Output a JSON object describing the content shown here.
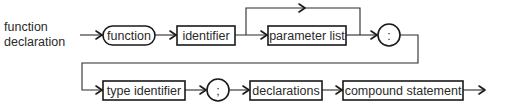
{
  "diagram": {
    "type": "syntax-diagram",
    "title_line1": "function",
    "title_line2": "declaration",
    "nodes": [
      {
        "id": "function",
        "label": "function",
        "kind": "terminal",
        "shape": "rounded"
      },
      {
        "id": "identifier",
        "label": "identifier",
        "kind": "nonterminal",
        "shape": "box"
      },
      {
        "id": "parameter-list",
        "label": "parameter list",
        "kind": "nonterminal",
        "shape": "box",
        "optional": true
      },
      {
        "id": "colon",
        "label": ":",
        "kind": "terminal",
        "shape": "circle"
      },
      {
        "id": "type-identifier",
        "label": "type identifier",
        "kind": "nonterminal",
        "shape": "box"
      },
      {
        "id": "semicolon",
        "label": ";",
        "kind": "terminal",
        "shape": "circle"
      },
      {
        "id": "declarations",
        "label": "declarations",
        "kind": "nonterminal",
        "shape": "box"
      },
      {
        "id": "compound-statement",
        "label": "compound statement",
        "kind": "nonterminal",
        "shape": "box"
      }
    ],
    "edges": [
      {
        "from": "start",
        "to": "function"
      },
      {
        "from": "function",
        "to": "identifier"
      },
      {
        "from": "identifier",
        "to": "parameter-list"
      },
      {
        "from": "identifier",
        "to": "colon",
        "note": "bypass over parameter list"
      },
      {
        "from": "parameter-list",
        "to": "colon"
      },
      {
        "from": "colon",
        "to": "type-identifier",
        "note": "wraps to second row"
      },
      {
        "from": "type-identifier",
        "to": "semicolon"
      },
      {
        "from": "semicolon",
        "to": "declarations"
      },
      {
        "from": "declarations",
        "to": "compound-statement"
      },
      {
        "from": "compound-statement",
        "to": "end"
      }
    ]
  }
}
